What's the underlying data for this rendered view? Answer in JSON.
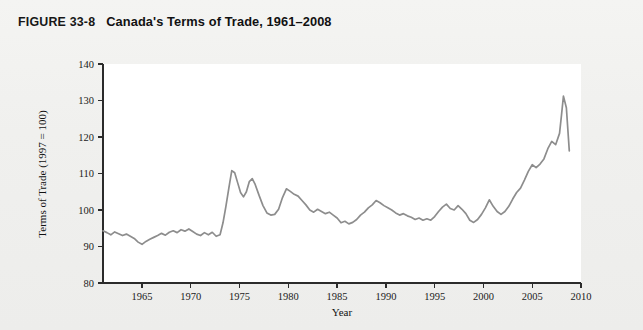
{
  "figure": {
    "number": "FIGURE 33-8",
    "title": "Canada's Terms of Trade, 1961–2008"
  },
  "colors": {
    "page_background": "#f1f1ef",
    "plot_background": "#ffffff",
    "axis": "#2b2b2b",
    "series_line": "#8d8d8d",
    "text": "#111111"
  },
  "chart_data": {
    "type": "line",
    "title": "Canada's Terms of Trade, 1961–2008",
    "xlabel": "Year",
    "ylabel": "Terms of Trade (1997 = 100)",
    "xlim": [
      1961,
      2010
    ],
    "ylim": [
      80,
      140
    ],
    "xticks": [
      1965,
      1970,
      1975,
      1980,
      1985,
      1990,
      1995,
      2000,
      2005,
      2010
    ],
    "yticks": [
      80,
      90,
      100,
      110,
      120,
      130,
      140
    ],
    "grid": false,
    "legend": false,
    "series": [
      {
        "name": "Terms of Trade (1997 = 100)",
        "color": "#8d8d8d",
        "x": [
          1961.0,
          1961.4,
          1961.8,
          1962.2,
          1962.6,
          1963.0,
          1963.4,
          1963.8,
          1964.2,
          1964.6,
          1965.0,
          1965.4,
          1965.8,
          1966.2,
          1966.6,
          1967.0,
          1967.4,
          1967.8,
          1968.2,
          1968.6,
          1969.0,
          1969.4,
          1969.8,
          1970.2,
          1970.6,
          1971.0,
          1971.4,
          1971.8,
          1972.2,
          1972.6,
          1973.0,
          1973.3,
          1973.6,
          1973.9,
          1974.2,
          1974.5,
          1974.8,
          1975.1,
          1975.4,
          1975.7,
          1976.0,
          1976.3,
          1976.6,
          1977.0,
          1977.4,
          1977.8,
          1978.2,
          1978.6,
          1979.0,
          1979.4,
          1979.8,
          1980.2,
          1980.6,
          1981.0,
          1981.4,
          1981.8,
          1982.2,
          1982.6,
          1983.0,
          1983.4,
          1983.8,
          1984.2,
          1984.6,
          1985.0,
          1985.4,
          1985.8,
          1986.2,
          1986.6,
          1987.0,
          1987.4,
          1987.8,
          1988.2,
          1988.6,
          1989.0,
          1989.4,
          1989.8,
          1990.2,
          1990.6,
          1991.0,
          1991.4,
          1991.8,
          1992.2,
          1992.6,
          1993.0,
          1993.4,
          1993.8,
          1994.2,
          1994.6,
          1995.0,
          1995.4,
          1995.8,
          1996.2,
          1996.6,
          1997.0,
          1997.4,
          1997.8,
          1998.2,
          1998.6,
          1999.0,
          1999.4,
          1999.8,
          2000.2,
          2000.6,
          2001.0,
          2001.4,
          2001.8,
          2002.2,
          2002.6,
          2003.0,
          2003.4,
          2003.8,
          2004.2,
          2004.6,
          2005.0,
          2005.4,
          2005.8,
          2006.2,
          2006.6,
          2007.0,
          2007.4,
          2007.8,
          2008.0,
          2008.2,
          2008.5,
          2008.8
        ],
        "y": [
          94.3,
          93.8,
          93.2,
          94.0,
          93.5,
          93.0,
          93.4,
          92.8,
          92.2,
          91.2,
          90.6,
          91.4,
          92.0,
          92.5,
          93.0,
          93.6,
          93.1,
          93.9,
          94.3,
          93.8,
          94.6,
          94.2,
          94.8,
          94.1,
          93.4,
          93.0,
          93.8,
          93.2,
          93.9,
          92.8,
          93.2,
          96.5,
          101.0,
          106.0,
          110.8,
          110.2,
          107.5,
          104.8,
          103.6,
          105.0,
          107.8,
          108.6,
          107.0,
          104.0,
          101.2,
          99.2,
          98.6,
          98.8,
          100.2,
          103.4,
          105.8,
          105.1,
          104.3,
          103.8,
          102.6,
          101.4,
          100.0,
          99.4,
          100.2,
          99.6,
          99.0,
          99.4,
          98.6,
          97.8,
          96.5,
          96.9,
          96.2,
          96.6,
          97.4,
          98.6,
          99.4,
          100.6,
          101.4,
          102.6,
          102.0,
          101.2,
          100.6,
          100.0,
          99.2,
          98.6,
          99.0,
          98.4,
          98.0,
          97.4,
          97.8,
          97.2,
          97.6,
          97.2,
          98.2,
          99.6,
          100.8,
          101.6,
          100.4,
          100.0,
          101.2,
          100.2,
          99.0,
          97.2,
          96.6,
          97.4,
          98.8,
          100.6,
          102.8,
          101.0,
          99.6,
          98.8,
          99.6,
          101.0,
          103.0,
          104.8,
          106.0,
          108.2,
          110.6,
          112.4,
          111.6,
          112.6,
          114.0,
          116.8,
          118.8,
          117.9,
          121.0,
          126.0,
          131.2,
          128.0,
          116.2
        ]
      }
    ]
  },
  "axes": {
    "y_axis_title": "Terms of Trade (1997 = 100)",
    "x_axis_title": "Year",
    "y_tick_labels": [
      "80",
      "90",
      "100",
      "110",
      "120",
      "130",
      "140"
    ],
    "x_tick_labels": [
      "1965",
      "1970",
      "1975",
      "1980",
      "1985",
      "1990",
      "1995",
      "2000",
      "2005",
      "2010"
    ]
  }
}
